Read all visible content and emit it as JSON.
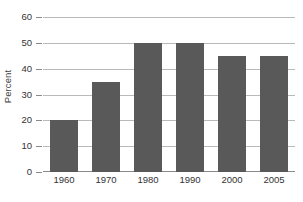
{
  "chart_data": {
    "type": "bar",
    "title": "",
    "subtitle": "",
    "xlabel": "",
    "ylabel": "Percent",
    "categories": [
      "1960",
      "1970",
      "1980",
      "1990",
      "2000",
      "2005"
    ],
    "values": [
      20,
      35,
      50,
      50,
      45,
      45
    ],
    "ylim": [
      0,
      60
    ],
    "yticks": [
      0,
      10,
      20,
      30,
      40,
      50,
      60
    ],
    "ytick_labels": [
      "0",
      "10",
      "20",
      "30",
      "40",
      "50",
      "60"
    ],
    "grid": true,
    "legend": false,
    "legend_position": "none",
    "annotations": [],
    "colors": {
      "bar_fill": "#595959",
      "gridline": "#b9b9b9",
      "axis_line": "#8a8a8a",
      "tick_label": "#333333",
      "axis_title": "#404040",
      "background": "#ffffff"
    }
  }
}
